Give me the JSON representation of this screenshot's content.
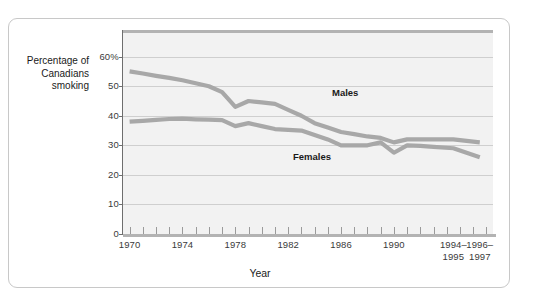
{
  "chart_data": {
    "type": "line",
    "title": "",
    "xlabel": "Year",
    "ylabel": "Percentage of Canadians smoking",
    "ylabel_lines": [
      "Percentage of",
      "Canadians",
      "smoking"
    ],
    "ylim": [
      0,
      68
    ],
    "ytick_values": [
      60,
      50,
      40,
      30,
      20,
      10,
      0
    ],
    "ytick_labels": [
      "60%",
      "50",
      "40",
      "30",
      "20",
      "10",
      "0"
    ],
    "grid": true,
    "grid_axis": "y",
    "legend_position": "inline-labels",
    "xlim": [
      1969.5,
      1997.5
    ],
    "xtick_values": [
      1970,
      1974,
      1978,
      1982,
      1986,
      1990,
      1994.5,
      1996.5
    ],
    "xtick_labels": [
      {
        "line1": "1970",
        "line2": ""
      },
      {
        "line1": "1974",
        "line2": ""
      },
      {
        "line1": "1978",
        "line2": ""
      },
      {
        "line1": "1982",
        "line2": ""
      },
      {
        "line1": "1986",
        "line2": ""
      },
      {
        "line1": "1990",
        "line2": ""
      },
      {
        "line1": "1994–",
        "line2": "1995"
      },
      {
        "line1": "1996–",
        "line2": "1997"
      }
    ],
    "xminor_ticks": [
      1970,
      1971,
      1972,
      1973,
      1974,
      1975,
      1976,
      1977,
      1978,
      1979,
      1980,
      1981,
      1982,
      1983,
      1984,
      1985,
      1986,
      1987,
      1988,
      1989,
      1990,
      1991,
      1992,
      1993,
      1994,
      1995,
      1996,
      1997
    ],
    "series": [
      {
        "name": "Males",
        "color": "#a8a8a8",
        "x": [
          1970,
          1971,
          1972,
          1973,
          1974,
          1975,
          1976,
          1977,
          1978,
          1979,
          1980,
          1981,
          1982,
          1983,
          1984,
          1985,
          1986,
          1987,
          1988,
          1989,
          1990,
          1991,
          1992,
          1993,
          1994.5,
          1996.5
        ],
        "values": [
          55,
          54.3,
          53.5,
          52.8,
          52,
          51,
          50,
          48,
          43,
          45,
          44.5,
          44,
          42,
          40,
          37.5,
          36,
          34.5,
          33.8,
          33,
          32.5,
          31,
          32,
          32,
          32,
          32,
          31
        ]
      },
      {
        "name": "Females",
        "color": "#a8a8a8",
        "x": [
          1970,
          1971,
          1972,
          1973,
          1974,
          1975,
          1976,
          1977,
          1978,
          1979,
          1980,
          1981,
          1982,
          1983,
          1984,
          1985,
          1986,
          1987,
          1988,
          1989,
          1990,
          1991,
          1992,
          1993,
          1994.5,
          1996.5
        ],
        "values": [
          38,
          38.3,
          38.6,
          38.9,
          39,
          38.8,
          38.7,
          38.5,
          36.5,
          37.5,
          36.5,
          35.5,
          35.2,
          35,
          33.5,
          32,
          30,
          30,
          30,
          31,
          27.5,
          30,
          29.8,
          29.5,
          29,
          26
        ]
      }
    ]
  },
  "style": {
    "plot_background": "#f2f2f2",
    "grid_color": "#cfcfcf",
    "axis_color": "#6e6e6e",
    "line_color": "#a8a8a8",
    "text_color": "#1a1a1a",
    "frame_color": "#c8c8c8"
  }
}
